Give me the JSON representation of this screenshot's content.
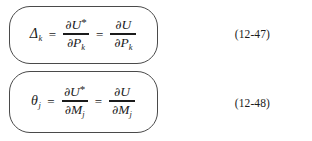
{
  "page": {
    "kind": "textbook-equation-excerpt",
    "background_color": "#ffffff",
    "text_color": "#1b1b1b",
    "box_border_color": "#4a4a4a"
  },
  "equations": [
    {
      "id": "eq-12-47",
      "number": "(12-47)",
      "lhs_symbol": "Δ",
      "lhs_subscript": "k",
      "relation_1": "=",
      "relation_2": "=",
      "fraction_1": {
        "numerator_operator": "∂",
        "numerator_variable": "U",
        "numerator_superscript": "*",
        "denominator_operator": "∂",
        "denominator_variable": "P",
        "denominator_subscript": "k"
      },
      "fraction_2": {
        "numerator_operator": "∂",
        "numerator_variable": "U",
        "numerator_superscript": "",
        "denominator_operator": "∂",
        "denominator_variable": "P",
        "denominator_subscript": "k"
      },
      "plain_text": "Δk = ∂U*/∂Pk = ∂U/∂Pk"
    },
    {
      "id": "eq-12-48",
      "number": "(12-48)",
      "lhs_symbol": "θ",
      "lhs_subscript": "j",
      "relation_1": "=",
      "relation_2": "=",
      "fraction_1": {
        "numerator_operator": "∂",
        "numerator_variable": "U",
        "numerator_superscript": "*",
        "denominator_operator": "∂",
        "denominator_variable": "M",
        "denominator_subscript": "j"
      },
      "fraction_2": {
        "numerator_operator": "∂",
        "numerator_variable": "U",
        "numerator_superscript": "",
        "denominator_operator": "∂",
        "denominator_variable": "M",
        "denominator_subscript": "j"
      },
      "plain_text": "θj = ∂U*/∂Mj = ∂U/∂Mj"
    }
  ]
}
